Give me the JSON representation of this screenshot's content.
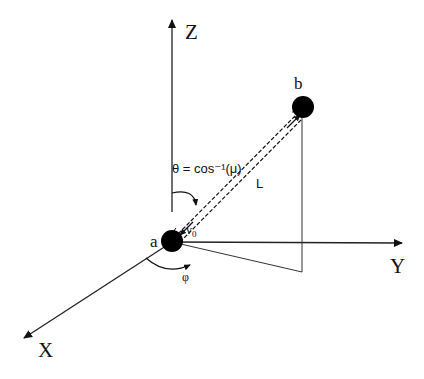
{
  "diagram": {
    "axes": {
      "z": {
        "label": "Z"
      },
      "y": {
        "label": "Y"
      },
      "x": {
        "label": "X"
      }
    },
    "points": {
      "a": {
        "label": "a"
      },
      "b": {
        "label": "b"
      }
    },
    "annotations": {
      "theta": "θ = cos⁻¹(μ)",
      "length": "L",
      "velocity": "v",
      "velocity_sub": "0",
      "phi": "φ"
    },
    "colors": {
      "ink": "#111111",
      "background": "#ffffff"
    }
  }
}
